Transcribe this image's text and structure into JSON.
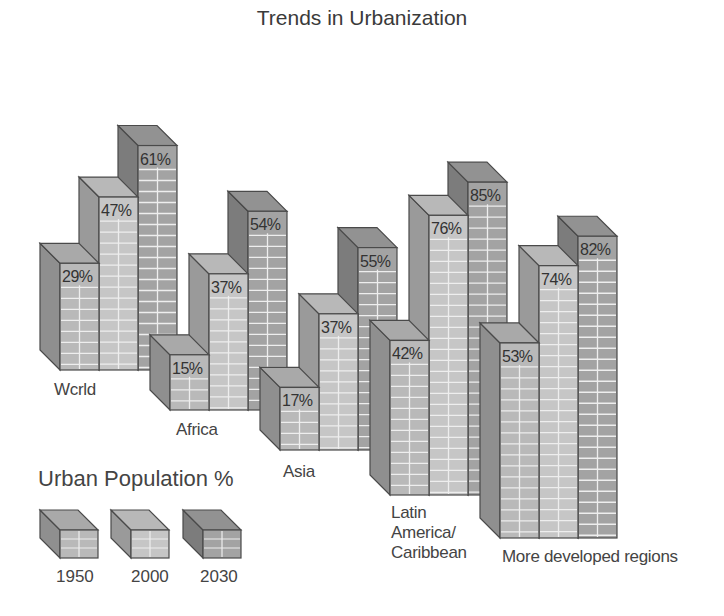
{
  "chart_data": {
    "type": "bar",
    "style": "3d-grouped",
    "title": "Trends in Urbanization",
    "xlabel": "",
    "ylabel": "",
    "categories": [
      "World",
      "Africa",
      "Asia",
      "Latin America/ Caribbean",
      "More developed regions"
    ],
    "category_labels_as_rendered": [
      "Wcrld",
      "Africa",
      "Asia",
      "Latin America/ Caribbean",
      "More developed regions"
    ],
    "series": [
      {
        "name": "1950",
        "values": [
          29,
          15,
          17,
          42,
          53
        ]
      },
      {
        "name": "2000",
        "values": [
          47,
          37,
          37,
          76,
          74
        ]
      },
      {
        "name": "2030",
        "values": [
          61,
          54,
          55,
          85,
          82
        ]
      }
    ],
    "legend": {
      "title": "Urban Population %",
      "entries": [
        "1950",
        "2000",
        "2030"
      ],
      "position": "bottom-left"
    },
    "grid": false,
    "ylim": [
      0,
      100
    ]
  },
  "labels": {
    "title": "Trends in Urbanization",
    "legend_title": "Urban Population %",
    "cat_world": "Wcrld",
    "cat_africa": "Africa",
    "cat_asia": "Asia",
    "cat_latam_1": "Latin",
    "cat_latam_2": "America/",
    "cat_latam_3": "Caribbean",
    "cat_developed": "More developed regions",
    "leg_1950": "1950",
    "leg_2000": "2000",
    "leg_2030": "2030"
  },
  "colors": {
    "s1950": {
      "front": "#b9b9b9",
      "side": "#8f8f8f",
      "top": "#a9a9a9"
    },
    "s2000": {
      "front": "#c6c6c6",
      "side": "#9a9a9a",
      "top": "#b8b8b8"
    },
    "s2030": {
      "front": "#a3a3a3",
      "side": "#7c7c7c",
      "top": "#929292"
    },
    "outline": "#4a4a4a",
    "grid_line": "#eeeeee"
  }
}
